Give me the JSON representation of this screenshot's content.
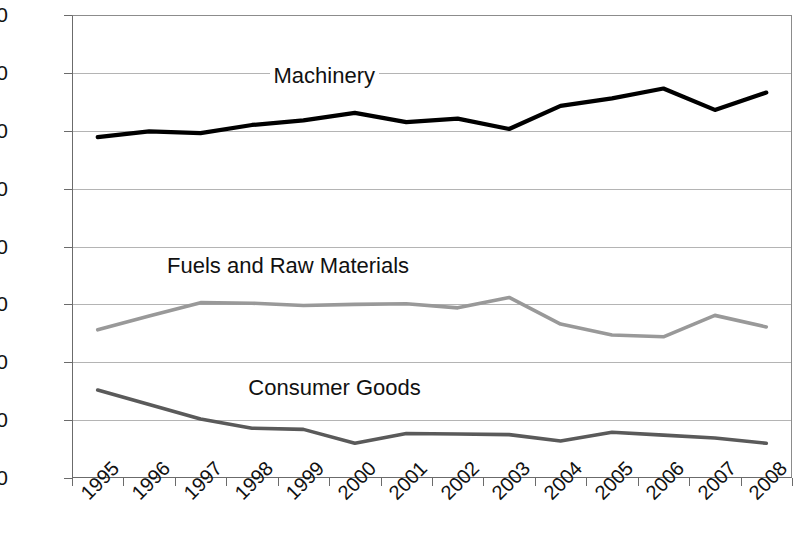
{
  "chart_data": {
    "type": "line",
    "title": "",
    "subtitle": "",
    "xlabel": "",
    "ylabel": "",
    "grid": true,
    "legend_position": "inline-labels",
    "xlim": [
      1995,
      2009
    ],
    "ylim": [
      0,
      80
    ],
    "x": [
      1995,
      1996,
      1997,
      1998,
      1999,
      2000,
      2001,
      2002,
      2003,
      2004,
      2005,
      2006,
      2007,
      2008
    ],
    "categories": [
      "1995",
      "1996",
      "1997",
      "1998",
      "1999",
      "2000",
      "2001",
      "2002",
      "2003",
      "2004",
      "2005",
      "2006",
      "2007",
      "2008"
    ],
    "y_ticks": [
      0,
      10,
      20,
      30,
      40,
      50,
      60,
      70,
      80
    ],
    "y_tick_labels": [
      "0",
      "10",
      "20",
      "30",
      "40",
      "50",
      "60",
      "70",
      "80"
    ],
    "series": [
      {
        "name": "Machinery",
        "color": "#000000",
        "values": [
          58.9,
          59.9,
          59.6,
          61.0,
          61.8,
          63.1,
          61.5,
          62.1,
          60.3,
          64.3,
          65.6,
          67.3,
          63.6,
          66.6
        ],
        "label_x": 1999.9,
        "label_y": 69.5
      },
      {
        "name": "Fuels and Raw Materials",
        "color": "#999999",
        "values": [
          25.6,
          28.0,
          30.3,
          30.2,
          29.8,
          30.0,
          30.1,
          29.4,
          31.2,
          26.6,
          24.7,
          24.4,
          28.1,
          26.1
        ],
        "label_x": 1999.2,
        "label_y": 36.6
      },
      {
        "name": "Consumer Goods",
        "color": "#5a5a5a",
        "values": [
          15.2,
          12.7,
          10.2,
          8.6,
          8.4,
          6.0,
          7.7,
          7.6,
          7.5,
          6.4,
          7.9,
          7.4,
          6.9,
          6.0
        ],
        "label_x": 2000.1,
        "label_y": 15.6
      }
    ]
  },
  "axes": {
    "y_label_color": "#111111",
    "x_label_rotation": "-45"
  }
}
